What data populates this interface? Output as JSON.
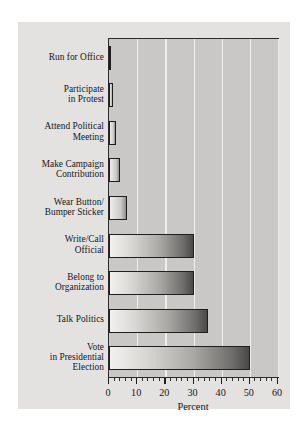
{
  "chart_data": {
    "type": "bar",
    "orientation": "horizontal",
    "title": "",
    "xlabel": "Percent",
    "ylabel": "",
    "xlim": [
      0,
      60
    ],
    "xticks": [
      0,
      10,
      20,
      30,
      40,
      50,
      60
    ],
    "xticklabels": [
      "0",
      "10",
      "20",
      "30",
      "40",
      "50",
      "60"
    ],
    "minor_tick_interval": 2,
    "grid": "vertical-white-gridlines",
    "legend": "none",
    "categories": [
      "Run for Office",
      "Participate in Protest",
      "Attend Political Meeting",
      "Make Campaign Contribution",
      "Wear Button/ Bumper Sticker",
      "Write/Call Official",
      "Belong to Organization",
      "Talk Politics",
      "Vote in Presidential Election"
    ],
    "values": [
      0.8,
      1.5,
      2.5,
      4,
      6.5,
      30,
      30,
      35,
      50
    ],
    "bars": [
      {
        "label_lines": [
          "Run for Office"
        ],
        "value": 0.8
      },
      {
        "label_lines": [
          "Participate",
          "in Protest"
        ],
        "value": 1.5
      },
      {
        "label_lines": [
          "Attend Political",
          "Meeting"
        ],
        "value": 2.5
      },
      {
        "label_lines": [
          "Make Campaign",
          "Contribution"
        ],
        "value": 4
      },
      {
        "label_lines": [
          "Wear Button/",
          "Bumper Sticker"
        ],
        "value": 6.5
      },
      {
        "label_lines": [
          "Write/Call",
          "Official"
        ],
        "value": 30
      },
      {
        "label_lines": [
          "Belong to",
          "Organization"
        ],
        "value": 30
      },
      {
        "label_lines": [
          "Talk Politics"
        ],
        "value": 35
      },
      {
        "label_lines": [
          "Vote",
          "in Presidential",
          "Election"
        ],
        "value": 50
      }
    ],
    "colors": {
      "figure_background": "#e3e2e0",
      "plot_background": "#c9c8c6",
      "gridline": "#f0efed",
      "axis": "#1e1e1e",
      "bar_light": "#f2f1ef",
      "bar_dark": "#4a4947",
      "text": "#14161c"
    }
  }
}
